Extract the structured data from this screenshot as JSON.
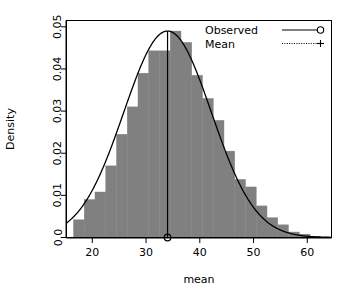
{
  "chart_data": {
    "type": "bar",
    "title": "",
    "subtitle": "",
    "xlabel": "mean",
    "ylabel": "Density",
    "xlim": [
      15.2,
      64.5
    ],
    "ylim": [
      0.0,
      0.0515
    ],
    "grid": false,
    "histogram": {
      "bin_width": 2,
      "bin_edges": [
        16.5,
        18.5,
        20.5,
        22.5,
        24.5,
        26.5,
        28.5,
        30.5,
        32.5,
        34.5,
        36.5,
        38.5,
        40.5,
        42.5,
        44.5,
        46.5,
        48.5,
        50.5,
        52.5,
        54.5,
        56.5,
        58.5,
        60.5,
        62.5
      ],
      "bin_centers": [
        17.5,
        19.5,
        21.5,
        23.5,
        25.5,
        27.5,
        29.5,
        31.5,
        33.5,
        35.5,
        37.5,
        39.5,
        41.5,
        43.5,
        45.5,
        47.5,
        49.5,
        51.5,
        53.5,
        55.5,
        57.5,
        59.5,
        61.5
      ],
      "densities": [
        0.0042,
        0.009,
        0.0108,
        0.017,
        0.0245,
        0.031,
        0.039,
        0.0443,
        0.0443,
        0.049,
        0.0463,
        0.0385,
        0.033,
        0.0278,
        0.0205,
        0.0138,
        0.012,
        0.0075,
        0.0047,
        0.003,
        0.0013,
        0.0008,
        0.0003
      ]
    },
    "curve": {
      "name": "normal-density-overlay",
      "mean": 34.0,
      "sd": 8.15,
      "peak_density": 0.049
    },
    "mean_marker": {
      "value": 34.0,
      "x": 34.0,
      "y_top": 0.049,
      "y_bottom": 0.0
    },
    "xticks": [
      20,
      30,
      40,
      50,
      60
    ],
    "xtick_labels": [
      "20",
      "30",
      "40",
      "50",
      "60"
    ],
    "yticks": [
      0.0,
      0.01,
      0.02,
      0.03,
      0.04,
      0.05
    ],
    "ytick_labels": [
      "0.0",
      "0.01",
      "0.02",
      "0.03",
      "0.04",
      "0.05"
    ],
    "legend": {
      "position": "top-right",
      "entries": [
        {
          "label": "Observed",
          "line_style": "solid",
          "marker": "circle"
        },
        {
          "label": "Mean",
          "line_style": "dotted",
          "marker": "plus"
        }
      ]
    },
    "colors": {
      "bar_fill": "#808080",
      "bar_border": "#808080",
      "curve": "#000000",
      "axis": "#000000",
      "background": "#ffffff"
    }
  }
}
